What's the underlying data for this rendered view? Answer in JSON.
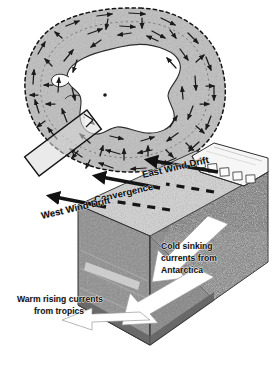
{
  "figure": {
    "background_color": "#ffffff"
  },
  "map": {
    "name": "Polar map of Antarctica",
    "continent_label": "Antarctica",
    "pole_marker": "south-pole-dot",
    "ocean_color": "#b9b9b9",
    "land_color": "#ffffff",
    "boundary_style": "dashed",
    "boundary_label": "Antarctic Convergence",
    "section_box_label": "cross-section location",
    "arrow_color": "#1a1a1a",
    "arrow_count": 64
  },
  "block": {
    "name": "Cut-away block diagram",
    "labels": {
      "east_wind_drift": "East Wind Drift",
      "convergence": "Convergence",
      "west_wind_drift": "West Wind Drift",
      "cold_sinking_line1": "Cold sinking",
      "cold_sinking_line2": "currents from",
      "cold_sinking_line3": "Antarctica",
      "warm_rising_line1": "Warm rising currents",
      "warm_rising_line2": "from tropics"
    },
    "colors": {
      "sea_surface": "#cfcfcf",
      "cut_face_left": "#8d8d8d",
      "cut_face_front": "#9a9a9a",
      "land_speckled": "#6e6e6e",
      "ice_shelf": "#f4f4f4",
      "surface_arrow": "#151515",
      "current_arrow": "#ffffff"
    },
    "surface_arrow_rows": 3,
    "white_arrows": [
      "cold-sinking-arrow-1",
      "cold-sinking-arrow-2",
      "warm-rising-arrow"
    ]
  }
}
